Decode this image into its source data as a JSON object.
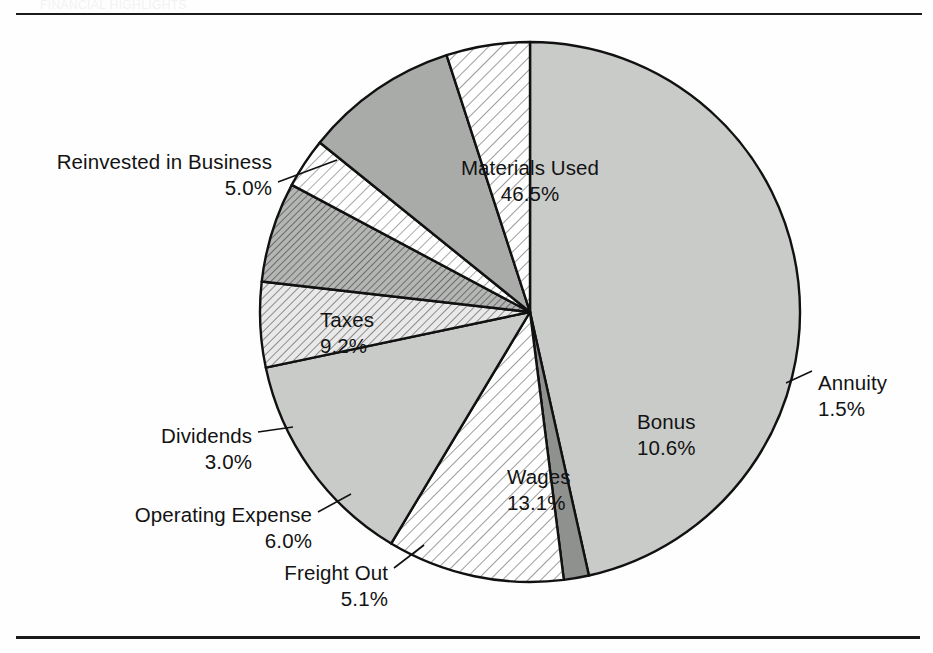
{
  "page": {
    "background_color": "#fefefe",
    "rule_color": "#1a1a1a",
    "faint_header_text": "FINANCIAL HIGHLIGHTS"
  },
  "chart_data": {
    "type": "pie",
    "title": "",
    "subtitle": "",
    "xlabel": "",
    "ylabel": "",
    "legend_position": "callout-labels",
    "grid": false,
    "total": 100.0,
    "units": "percent",
    "start_angle_deg": 0,
    "direction": "clockwise",
    "center": {
      "x": 530,
      "y": 312
    },
    "radius": 270,
    "categories": [
      "Materials Used",
      "Annuity",
      "Bonus",
      "Wages",
      "Freight Out",
      "Operating Expense",
      "Dividends",
      "Taxes",
      "Reinvested in Business"
    ],
    "values": [
      46.5,
      1.5,
      10.6,
      13.1,
      5.1,
      6.0,
      3.0,
      9.2,
      5.0
    ],
    "slices": [
      {
        "label": "Materials Used",
        "value": 46.5,
        "pct_text": "46.5%",
        "fill": "#c9cbc9",
        "pattern": "solid",
        "label_placement": "inside",
        "label_x": 530,
        "label_y": 155,
        "align": "center",
        "leader": false
      },
      {
        "label": "Annuity",
        "value": 1.5,
        "pct_text": "1.5%",
        "fill": "#8f918f",
        "pattern": "solid",
        "label_placement": "outside",
        "label_x": 818,
        "label_y": 370,
        "align": "left",
        "leader": true,
        "leader_from_x": 786,
        "leader_from_y": 383,
        "leader_to_x": 812,
        "leader_to_y": 371
      },
      {
        "label": "Bonus",
        "value": 10.6,
        "pct_text": "10.6%",
        "fill": "#ffffff",
        "pattern": "diagonal-hatch",
        "label_placement": "inside",
        "label_x": 637,
        "label_y": 409,
        "align": "left",
        "leader": false
      },
      {
        "label": "Wages",
        "value": 13.1,
        "pct_text": "13.1%",
        "fill": "#c9cbc9",
        "pattern": "solid",
        "label_placement": "inside",
        "label_x": 507,
        "label_y": 464,
        "align": "left",
        "leader": false
      },
      {
        "label": "Freight Out",
        "value": 5.1,
        "pct_text": "5.1%",
        "fill": "#ffffff",
        "pattern": "diagonal-hatch-medium",
        "label_placement": "outside",
        "label_x": 388,
        "label_y": 560,
        "align": "right",
        "leader": true,
        "leader_from_x": 394,
        "leader_from_y": 568,
        "leader_to_x": 424,
        "leader_to_y": 545
      },
      {
        "label": "Operating Expense",
        "value": 6.0,
        "pct_text": "6.0%",
        "fill": "#a9aba9",
        "pattern": "diagonal-hatch-dark",
        "label_placement": "outside",
        "label_x": 312,
        "label_y": 502,
        "align": "right",
        "leader": true,
        "leader_from_x": 318,
        "leader_from_y": 512,
        "leader_to_x": 351,
        "leader_to_y": 494
      },
      {
        "label": "Dividends",
        "value": 3.0,
        "pct_text": "3.0%",
        "fill": "#ffffff",
        "pattern": "diagonal-hatch-fine",
        "label_placement": "outside",
        "label_x": 252,
        "label_y": 423,
        "align": "right",
        "leader": true,
        "leader_from_x": 258,
        "leader_from_y": 432,
        "leader_to_x": 293,
        "leader_to_y": 427
      },
      {
        "label": "Taxes",
        "value": 9.2,
        "pct_text": "9.2%",
        "fill": "#a9aba9",
        "pattern": "solid",
        "label_placement": "inside",
        "label_x": 320,
        "label_y": 307,
        "align": "left",
        "leader": false
      },
      {
        "label": "Reinvested in Business",
        "value": 5.0,
        "pct_text": "5.0%",
        "fill": "#ffffff",
        "pattern": "diagonal-hatch",
        "label_placement": "outside",
        "label_x": 272,
        "label_y": 149,
        "align": "right",
        "leader": true,
        "leader_from_x": 278,
        "leader_from_y": 182,
        "leader_to_x": 337,
        "leader_to_y": 160
      }
    ]
  }
}
